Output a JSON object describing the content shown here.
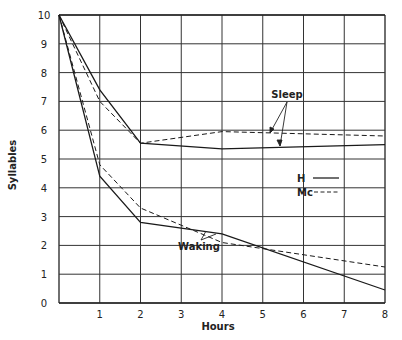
{
  "chart_data": {
    "type": "line",
    "title": "",
    "xlabel": "Hours",
    "ylabel": "Syllables",
    "xlim": [
      0,
      8
    ],
    "ylim": [
      0,
      10
    ],
    "grid": true,
    "x_ticks": [
      "1",
      "2",
      "3",
      "4",
      "5",
      "6",
      "7",
      "8"
    ],
    "y_ticks": [
      "0",
      "1",
      "2",
      "3",
      "4",
      "5",
      "6",
      "7",
      "8",
      "9",
      "10"
    ],
    "legend": {
      "position": "right-middle",
      "entries": [
        {
          "label": "H",
          "style": "solid"
        },
        {
          "label": "Mc",
          "style": "dashed"
        }
      ]
    },
    "annotations": [
      {
        "text": "Sleep",
        "points_to": [
          "Sleep Mc",
          "Sleep H"
        ]
      },
      {
        "text": "Waking",
        "points_to": [
          "Waking H",
          "Waking Mc"
        ]
      }
    ],
    "series": [
      {
        "name": "Sleep H",
        "style": "solid",
        "x": [
          0,
          1,
          2,
          4,
          8
        ],
        "values": [
          10,
          7.4,
          5.55,
          5.35,
          5.5
        ]
      },
      {
        "name": "Sleep Mc",
        "style": "dashed",
        "x": [
          0,
          1,
          2,
          4,
          8
        ],
        "values": [
          10,
          7.0,
          5.55,
          5.95,
          5.8
        ]
      },
      {
        "name": "Waking H",
        "style": "solid",
        "x": [
          0,
          1,
          2,
          4,
          8
        ],
        "values": [
          10,
          4.4,
          2.8,
          2.4,
          0.45
        ]
      },
      {
        "name": "Waking Mc",
        "style": "dashed",
        "x": [
          0,
          1,
          2,
          4,
          8
        ],
        "values": [
          10,
          4.8,
          3.3,
          2.1,
          1.25
        ]
      }
    ]
  },
  "labels": {
    "xlabel": "Hours",
    "ylabel": "Syllables",
    "sleep": "Sleep",
    "waking": "Waking",
    "legend_h": "H",
    "legend_mc": "Mc"
  }
}
